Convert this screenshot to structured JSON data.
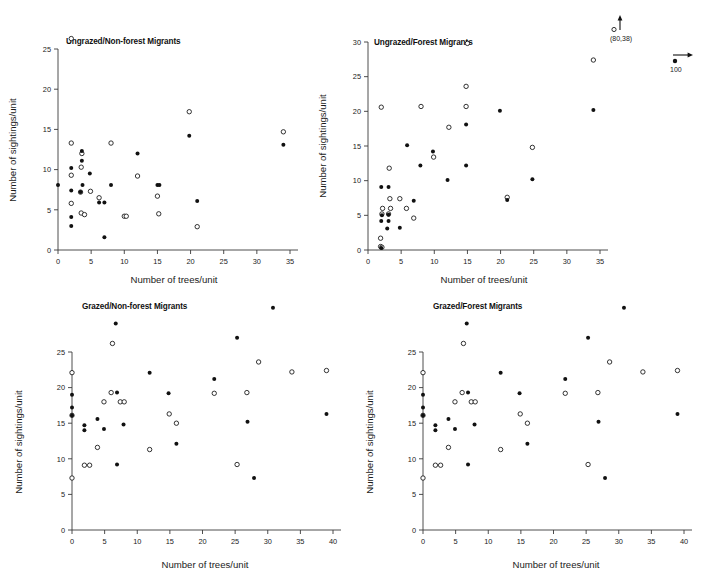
{
  "figure": {
    "axis_titles": {
      "x": "Number of trees/unit",
      "y": "Number of sightings/unit"
    },
    "annotations": {
      "offscale_point": {
        "label": "(80,38)",
        "marker_open": "open-circle",
        "marker_arrow": "up-arrow"
      },
      "scale_marker": {
        "label": "100",
        "marker_filled": "filled-circle",
        "marker_arrow": "right-arrow"
      }
    }
  },
  "chart_data": [
    {
      "type": "scatter",
      "id": "ungrazed-non-forest-migrants",
      "title": "Ungrazed/Non-forest Migrants",
      "xlabel": "Number of trees/unit",
      "ylabel": "Number of sightings/unit",
      "xlim": [
        0,
        35
      ],
      "ylim": [
        0,
        26.5
      ],
      "xticks": [
        0,
        5,
        10,
        15,
        20,
        25,
        30,
        35
      ],
      "yticks": [
        0,
        5,
        10,
        15,
        20,
        25
      ],
      "grid": false,
      "legend": "none",
      "series": [
        {
          "name": "open-circle",
          "marker": "open",
          "points": [
            [
              2.0,
              26.3
            ],
            [
              2.0,
              13.3
            ],
            [
              3.6,
              12.0
            ],
            [
              8.0,
              13.3
            ],
            [
              2.0,
              9.3
            ],
            [
              3.5,
              10.3
            ],
            [
              4.9,
              7.3
            ],
            [
              3.4,
              7.2
            ],
            [
              2.0,
              5.8
            ],
            [
              3.5,
              4.6
            ],
            [
              4.0,
              4.4
            ],
            [
              6.2,
              6.5
            ],
            [
              10.0,
              4.2
            ],
            [
              10.3,
              4.2
            ],
            [
              12.0,
              9.2
            ],
            [
              15.0,
              6.7
            ],
            [
              15.2,
              4.5
            ],
            [
              19.8,
              17.2
            ],
            [
              21.0,
              2.9
            ],
            [
              34.0,
              14.7
            ]
          ]
        },
        {
          "name": "filled-circle",
          "marker": "filled",
          "points": [
            [
              0.0,
              8.1
            ],
            [
              2.0,
              10.2
            ],
            [
              2.0,
              7.4
            ],
            [
              2.0,
              4.1
            ],
            [
              2.0,
              3.0
            ],
            [
              3.6,
              12.3
            ],
            [
              3.6,
              11.1
            ],
            [
              3.7,
              8.1
            ],
            [
              3.4,
              7.2
            ],
            [
              4.8,
              9.5
            ],
            [
              6.2,
              5.9
            ],
            [
              7.0,
              5.9
            ],
            [
              8.0,
              8.1
            ],
            [
              12.0,
              12.0
            ],
            [
              15.0,
              8.1
            ],
            [
              15.3,
              8.1
            ],
            [
              19.8,
              14.2
            ],
            [
              21.0,
              6.1
            ],
            [
              34.0,
              13.1
            ],
            [
              7.0,
              1.6
            ]
          ]
        }
      ]
    },
    {
      "type": "scatter",
      "id": "ungrazed-forest-migrants",
      "title": "Ungrazed/Forest Migrants",
      "xlabel": "Number of trees/unit",
      "ylabel": "Number of sightings/unit",
      "xlim": [
        0,
        35
      ],
      "ylim": [
        0,
        30
      ],
      "xticks": [
        0,
        5,
        10,
        15,
        20,
        25,
        30,
        35
      ],
      "yticks": [
        0,
        5,
        10,
        15,
        20,
        25,
        30
      ],
      "grid": false,
      "legend": "none",
      "series": [
        {
          "name": "open-circle",
          "marker": "open",
          "points": [
            [
              15.0,
              29.8
            ],
            [
              34.0,
              27.4
            ],
            [
              2.0,
              20.6
            ],
            [
              8.0,
              20.7
            ],
            [
              14.8,
              23.6
            ],
            [
              14.8,
              20.7
            ],
            [
              12.2,
              17.7
            ],
            [
              9.9,
              13.4
            ],
            [
              24.8,
              14.8
            ],
            [
              3.2,
              11.8
            ],
            [
              21.0,
              7.6
            ],
            [
              3.3,
              7.4
            ],
            [
              4.8,
              7.4
            ],
            [
              2.2,
              6.0
            ],
            [
              3.4,
              6.0
            ],
            [
              5.8,
              6.0
            ],
            [
              2.1,
              5.2
            ],
            [
              3.1,
              5.2
            ],
            [
              6.9,
              4.6
            ],
            [
              1.9,
              1.7
            ],
            [
              1.9,
              0.5
            ],
            [
              2.1,
              0.4
            ]
          ]
        },
        {
          "name": "filled-circle",
          "marker": "filled",
          "points": [
            [
              19.9,
              20.1
            ],
            [
              34.0,
              20.2
            ],
            [
              14.8,
              18.1
            ],
            [
              5.9,
              15.1
            ],
            [
              9.8,
              14.2
            ],
            [
              7.9,
              12.2
            ],
            [
              14.8,
              12.2
            ],
            [
              12.0,
              10.1
            ],
            [
              24.8,
              10.2
            ],
            [
              2.0,
              9.1
            ],
            [
              3.1,
              9.1
            ],
            [
              21.0,
              7.2
            ],
            [
              6.9,
              7.1
            ],
            [
              2.1,
              5.0
            ],
            [
              3.1,
              5.1
            ],
            [
              2.0,
              4.2
            ],
            [
              3.1,
              4.2
            ],
            [
              2.9,
              3.1
            ],
            [
              4.8,
              3.2
            ],
            [
              2.0,
              0.3
            ]
          ]
        }
      ]
    },
    {
      "type": "scatter",
      "id": "grazed-non-forest-migrants",
      "title": "Grazed/Non-forest Migrants",
      "xlabel": "Number of trees/unit",
      "ylabel": "Number of sightings/unit",
      "xlim": [
        0,
        40
      ],
      "ylim": [
        0,
        31.5
      ],
      "xticks": [
        0,
        5,
        10,
        15,
        20,
        25,
        30,
        35,
        40
      ],
      "yticks": [
        0,
        5,
        10,
        15,
        20,
        25
      ],
      "grid": false,
      "legend": "none",
      "series": [
        {
          "name": "open-circle",
          "marker": "open",
          "points": [
            [
              0.0,
              22.1
            ],
            [
              0.0,
              16.1
            ],
            [
              6.2,
              26.2
            ],
            [
              28.6,
              23.6
            ],
            [
              33.7,
              22.2
            ],
            [
              39.0,
              22.4
            ],
            [
              6.0,
              19.3
            ],
            [
              21.8,
              19.2
            ],
            [
              26.8,
              19.3
            ],
            [
              4.9,
              18.0
            ],
            [
              7.4,
              18.0
            ],
            [
              8.0,
              18.0
            ],
            [
              14.9,
              16.3
            ],
            [
              16.0,
              15.0
            ],
            [
              11.9,
              11.3
            ],
            [
              3.9,
              11.6
            ],
            [
              1.9,
              9.1
            ],
            [
              2.7,
              9.1
            ],
            [
              25.3,
              9.2
            ],
            [
              0.0,
              7.3
            ]
          ]
        },
        {
          "name": "filled-circle",
          "marker": "filled",
          "points": [
            [
              30.8,
              31.2
            ],
            [
              6.7,
              29.0
            ],
            [
              25.3,
              27.0
            ],
            [
              11.9,
              22.1
            ],
            [
              21.8,
              21.2
            ],
            [
              0.0,
              19.0
            ],
            [
              6.9,
              19.3
            ],
            [
              14.8,
              19.2
            ],
            [
              0.0,
              17.2
            ],
            [
              0.0,
              16.1
            ],
            [
              3.9,
              15.6
            ],
            [
              26.9,
              15.2
            ],
            [
              39.0,
              16.3
            ],
            [
              1.9,
              14.7
            ],
            [
              1.9,
              14.0
            ],
            [
              4.9,
              14.2
            ],
            [
              7.9,
              14.8
            ],
            [
              16.0,
              12.1
            ],
            [
              6.9,
              9.2
            ],
            [
              27.9,
              7.3
            ]
          ]
        }
      ]
    },
    {
      "type": "scatter",
      "id": "grazed-forest-migrants",
      "title": "Grazed/Forest Migrants",
      "xlabel": "Number of trees/unit",
      "ylabel": "Number of sightings/unit",
      "xlim": [
        0,
        40
      ],
      "ylim": [
        0,
        31.5
      ],
      "xticks": [
        0,
        5,
        10,
        15,
        20,
        25,
        30,
        35,
        40
      ],
      "yticks": [
        0,
        5,
        10,
        15,
        20,
        25
      ],
      "grid": false,
      "legend": "none",
      "series": [
        {
          "name": "open-circle",
          "marker": "open",
          "points": [
            [
              0.0,
              22.1
            ],
            [
              0.0,
              16.1
            ],
            [
              6.2,
              26.2
            ],
            [
              28.6,
              23.6
            ],
            [
              33.7,
              22.2
            ],
            [
              39.0,
              22.4
            ],
            [
              6.0,
              19.3
            ],
            [
              21.8,
              19.2
            ],
            [
              26.8,
              19.3
            ],
            [
              4.9,
              18.0
            ],
            [
              7.4,
              18.0
            ],
            [
              8.0,
              18.0
            ],
            [
              14.9,
              16.3
            ],
            [
              16.0,
              15.0
            ],
            [
              11.9,
              11.3
            ],
            [
              3.9,
              11.6
            ],
            [
              1.9,
              9.1
            ],
            [
              2.7,
              9.1
            ],
            [
              25.3,
              9.2
            ],
            [
              0.0,
              7.3
            ]
          ]
        },
        {
          "name": "filled-circle",
          "marker": "filled",
          "points": [
            [
              30.8,
              31.2
            ],
            [
              6.7,
              29.0
            ],
            [
              25.3,
              27.0
            ],
            [
              11.9,
              22.1
            ],
            [
              21.8,
              21.2
            ],
            [
              0.0,
              19.0
            ],
            [
              6.9,
              19.3
            ],
            [
              14.8,
              19.2
            ],
            [
              0.0,
              17.2
            ],
            [
              0.0,
              16.1
            ],
            [
              3.9,
              15.6
            ],
            [
              26.9,
              15.2
            ],
            [
              39.0,
              16.3
            ],
            [
              1.9,
              14.7
            ],
            [
              1.9,
              14.0
            ],
            [
              4.9,
              14.2
            ],
            [
              7.9,
              14.8
            ],
            [
              16.0,
              12.1
            ],
            [
              6.9,
              9.2
            ],
            [
              27.9,
              7.3
            ]
          ]
        }
      ]
    }
  ]
}
